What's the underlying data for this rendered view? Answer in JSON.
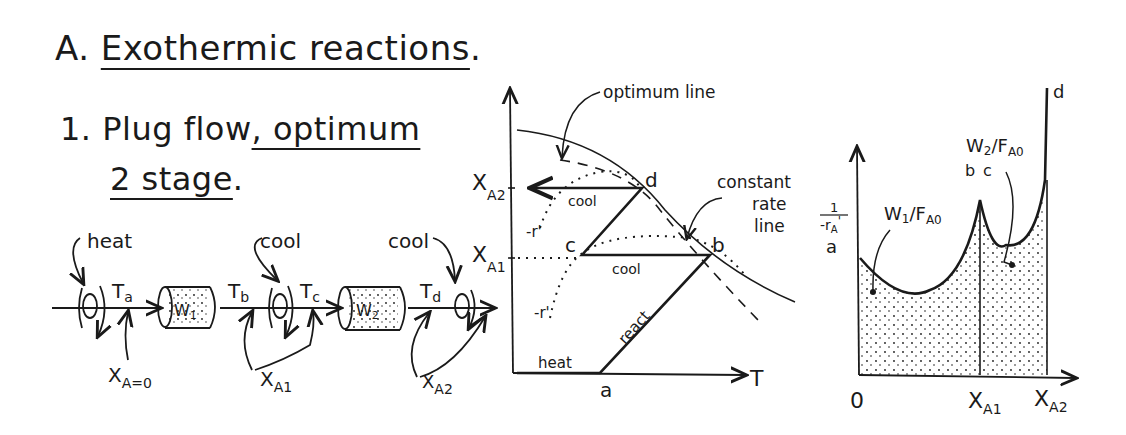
{
  "heading": {
    "section_prefix": "A.",
    "section_title": "Exothermic reactions",
    "section_suffix": ".",
    "item_number": "1.",
    "item_title_line1_a": "Plug flow",
    "item_title_line1_b": ", optimum",
    "item_title_line2": "2 stage",
    "item_title_line2_suffix": "."
  },
  "flow_diagram": {
    "labels": {
      "heat": "heat",
      "cool1": "cool",
      "cool2": "cool",
      "Ta": "T",
      "Ta_sub": "a",
      "Tb": "T",
      "Tb_sub": "b",
      "Tc": "T",
      "Tc_sub": "c",
      "Td": "T",
      "Td_sub": "d",
      "reactor1": "W",
      "reactor1_sub": "1",
      "reactor2": "W",
      "reactor2_sub": "2",
      "xa0": "X",
      "xa0_sub": "A=0",
      "xa1": "X",
      "xa1_sub": "A1",
      "xa2": "X",
      "xa2_sub": "A2"
    }
  },
  "xt_diagram": {
    "y_label_top": "X",
    "y_label_top_sub": "A2",
    "y_label_mid": "X",
    "y_label_mid_sub": "A1",
    "x_axis_label": "T",
    "points": {
      "a": "a",
      "b": "b",
      "c": "c",
      "d": "d"
    },
    "annotations": {
      "optimum_line": "optimum line",
      "constant_rate_line_1": "constant",
      "constant_rate_line_2": "rate",
      "constant_rate_line_3": "line",
      "cool_upper": "cool",
      "cool_lower": "cool",
      "react": "react",
      "heat": "heat",
      "rate_upper": "-r'",
      "rate_lower": "-r'"
    }
  },
  "area_diagram": {
    "y_label_num": "1",
    "y_label_den": "-r",
    "y_label_den_sub": "A",
    "y_label_den_sup": "'",
    "x_ticks": [
      {
        "label": "0",
        "sub": ""
      },
      {
        "label": "X",
        "sub": "A1"
      },
      {
        "label": "X",
        "sub": "A2"
      }
    ],
    "points": {
      "a": "a",
      "b": "b",
      "c": "c",
      "d": "d"
    },
    "area1_label": "W",
    "area1_label_sub": "1",
    "area1_label_den": "/F",
    "area1_label_den_sub": "A0",
    "area2_label": "W",
    "area2_label_sub": "2",
    "area2_label_den": "/F",
    "area2_label_den_sub": "A0"
  },
  "colors": {
    "ink": "#1a1a1a",
    "background": "#ffffff"
  }
}
